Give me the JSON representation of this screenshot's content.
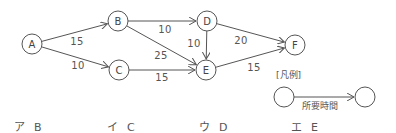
{
  "diagram": {
    "nodes": [
      {
        "id": "A",
        "label": "A",
        "x": 32,
        "y": 44
      },
      {
        "id": "B",
        "label": "B",
        "x": 118,
        "y": 21
      },
      {
        "id": "C",
        "label": "C",
        "x": 119,
        "y": 70
      },
      {
        "id": "D",
        "label": "D",
        "x": 207,
        "y": 21
      },
      {
        "id": "E",
        "label": "E",
        "x": 206,
        "y": 70
      },
      {
        "id": "F",
        "label": "F",
        "x": 295,
        "y": 45
      }
    ],
    "edges": [
      {
        "from": "A",
        "to": "B",
        "weight": "15",
        "lx": 77,
        "ly": 41
      },
      {
        "from": "A",
        "to": "C",
        "weight": "10",
        "lx": 78,
        "ly": 65
      },
      {
        "from": "B",
        "to": "D",
        "weight": "10",
        "lx": 165,
        "ly": 29
      },
      {
        "from": "B",
        "to": "E",
        "weight": "25",
        "lx": 161,
        "ly": 55
      },
      {
        "from": "C",
        "to": "E",
        "weight": "15",
        "lx": 162,
        "ly": 77
      },
      {
        "from": "D",
        "to": "E",
        "weight": "10",
        "lx": 194,
        "ly": 43
      },
      {
        "from": "D",
        "to": "F",
        "weight": "20",
        "lx": 241,
        "ly": 40
      },
      {
        "from": "E",
        "to": "F",
        "weight": "15",
        "lx": 254,
        "ly": 67
      }
    ],
    "node_radius": 10
  },
  "legend": {
    "title": "[凡例]",
    "edge_label": "所要時間"
  },
  "choices": [
    {
      "kana": "ア",
      "value": "B"
    },
    {
      "kana": "イ",
      "value": "C"
    },
    {
      "kana": "ウ",
      "value": "D"
    },
    {
      "kana": "エ",
      "value": "E"
    }
  ]
}
